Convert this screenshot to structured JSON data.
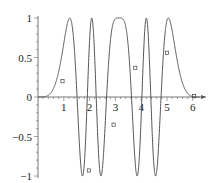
{
  "chart_data": {
    "type": "line",
    "title": "",
    "xlabel": "",
    "ylabel": "",
    "xlim": [
      0,
      6.28
    ],
    "ylim": [
      -1,
      1
    ],
    "grid": false,
    "legend": "none",
    "x_ticks": [
      {
        "value": 1,
        "label": "1"
      },
      {
        "value": 2,
        "label": "2"
      },
      {
        "value": 3,
        "label": "3"
      },
      {
        "value": 4,
        "label": "4"
      },
      {
        "value": 5,
        "label": "5"
      },
      {
        "value": 6,
        "label": "6"
      }
    ],
    "y_ticks": [
      {
        "value": 1,
        "label": "1"
      },
      {
        "value": 0.5,
        "label": "0.5"
      },
      {
        "value": 0,
        "label": "0"
      },
      {
        "value": -0.5,
        "label": "-0.5"
      },
      {
        "value": -1,
        "label": "-1"
      }
    ],
    "series": [
      {
        "name": "f(x)",
        "color": "#555555",
        "function": "sin(pi*(1 - cos(x))^2 / 1.6)",
        "x_range": [
          0,
          6.28
        ],
        "samples": 1200,
        "markers": [
          {
            "x": 0.95,
            "y": 0.2
          },
          {
            "x": 1.97,
            "y": -0.93
          },
          {
            "x": 2.93,
            "y": -0.35
          },
          {
            "x": 3.77,
            "y": 0.37
          },
          {
            "x": 5.0,
            "y": 0.56
          },
          {
            "x": 6.05,
            "y": 0.01
          }
        ]
      }
    ]
  }
}
